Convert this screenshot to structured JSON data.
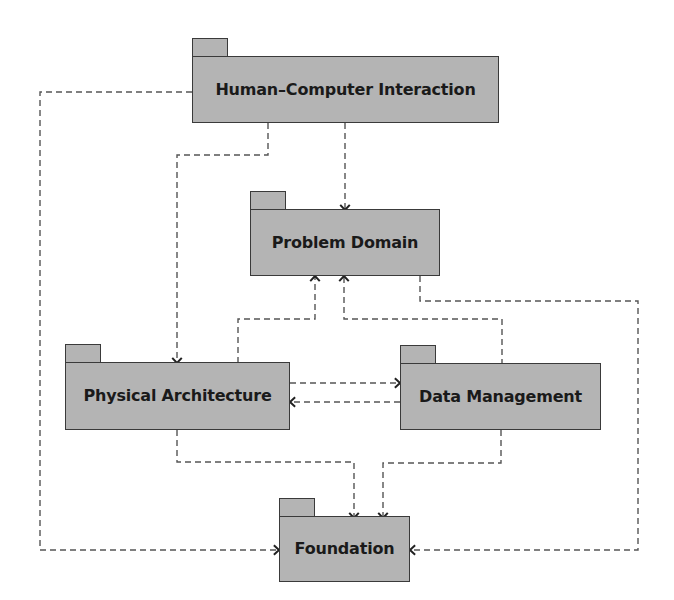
{
  "diagram": {
    "type": "uml-package-diagram",
    "colors": {
      "package_fill": "#b4b4b4",
      "package_border": "#3a3a3a",
      "dependency_line": "#555555",
      "label_text": "#1a1a1a",
      "background": "#ffffff"
    },
    "packages": [
      {
        "id": "hci",
        "label": "Human–Computer Interaction",
        "x": 192,
        "y": 38,
        "w": 307,
        "h": 85
      },
      {
        "id": "pd",
        "label": "Problem Domain",
        "x": 250,
        "y": 191,
        "w": 190,
        "h": 85
      },
      {
        "id": "pa",
        "label": "Physical Architecture",
        "x": 65,
        "y": 344,
        "w": 225,
        "h": 86
      },
      {
        "id": "dm",
        "label": "Data Management",
        "x": 400,
        "y": 345,
        "w": 201,
        "h": 85
      },
      {
        "id": "fnd",
        "label": "Foundation",
        "x": 279,
        "y": 498,
        "w": 131,
        "h": 84
      }
    ],
    "dependencies": [
      {
        "from": "Human–Computer Interaction",
        "to": "Problem Domain",
        "points": [
          [
            345,
            123
          ],
          [
            345,
            210
          ]
        ]
      },
      {
        "from": "Human–Computer Interaction",
        "to": "Physical Architecture",
        "points": [
          [
            268,
            123
          ],
          [
            268,
            155
          ],
          [
            177,
            155
          ],
          [
            177,
            363
          ]
        ]
      },
      {
        "from": "Human–Computer Interaction",
        "to": "Foundation",
        "points": [
          [
            192,
            92
          ],
          [
            40,
            92
          ],
          [
            40,
            550
          ],
          [
            279,
            550
          ]
        ]
      },
      {
        "from": "Physical Architecture",
        "to": "Problem Domain",
        "points": [
          [
            238,
            363
          ],
          [
            238,
            319
          ],
          [
            315,
            319
          ],
          [
            315,
            276
          ]
        ]
      },
      {
        "from": "Data Management",
        "to": "Problem Domain",
        "points": [
          [
            502,
            365
          ],
          [
            502,
            319
          ],
          [
            344,
            319
          ],
          [
            344,
            276
          ]
        ]
      },
      {
        "from": "Problem Domain",
        "to": "Foundation",
        "points": [
          [
            420,
            276
          ],
          [
            420,
            301
          ],
          [
            638,
            301
          ],
          [
            638,
            550
          ],
          [
            410,
            550
          ]
        ]
      },
      {
        "from": "Physical Architecture",
        "to": "Data Management",
        "points": [
          [
            290,
            383
          ],
          [
            400,
            383
          ]
        ]
      },
      {
        "from": "Data Management",
        "to": "Physical Architecture",
        "points": [
          [
            400,
            402
          ],
          [
            290,
            402
          ]
        ]
      },
      {
        "from": "Physical Architecture",
        "to": "Foundation",
        "points": [
          [
            177,
            430
          ],
          [
            177,
            462
          ],
          [
            354,
            462
          ],
          [
            354,
            518
          ]
        ]
      },
      {
        "from": "Data Management",
        "to": "Foundation",
        "points": [
          [
            501,
            430
          ],
          [
            501,
            463
          ],
          [
            383,
            463
          ],
          [
            383,
            518
          ]
        ]
      }
    ]
  }
}
